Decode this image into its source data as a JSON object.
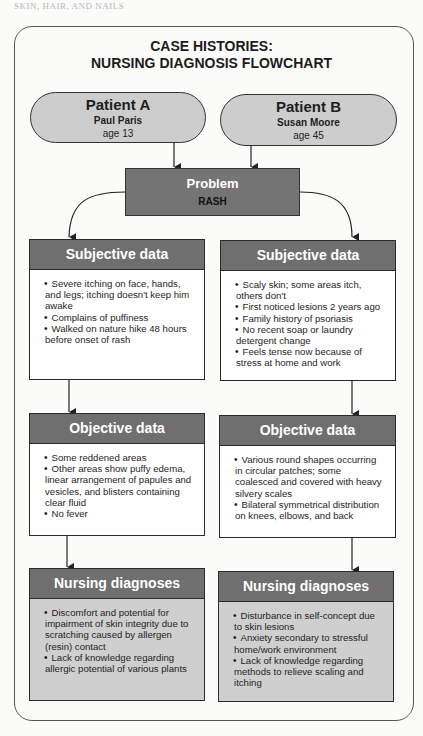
{
  "page_header": "SKIN, HAIR, AND NAILS",
  "title": {
    "line1": "CASE HISTORIES:",
    "line2": "NURSING DIAGNOSIS FLOWCHART"
  },
  "patients": [
    {
      "label": "Patient A",
      "name": "Paul Paris",
      "age": "age 13"
    },
    {
      "label": "Patient B",
      "name": "Susan Moore",
      "age": "age 45"
    }
  ],
  "problem": {
    "label": "Problem",
    "value": "RASH"
  },
  "columns": [
    {
      "subjective": {
        "title": "Subjective data",
        "items": [
          "Severe itching on face, hands, and legs; itching doesn't keep him awake",
          "Complains of puffiness",
          "Walked on nature hike 48 hours before onset of rash"
        ]
      },
      "objective": {
        "title": "Objective data",
        "items": [
          "Some reddened areas",
          "Other areas show puffy edema, linear arrangement of papules and vesicles, and blisters containing clear fluid",
          "No fever"
        ]
      },
      "diagnoses": {
        "title": "Nursing diagnoses",
        "items": [
          "Discomfort and potential for impairment of skin integrity due to scratching caused by allergen (resin) contact",
          "Lack of knowledge regarding allergic potential of various plants"
        ]
      }
    },
    {
      "subjective": {
        "title": "Subjective data",
        "items": [
          "Scaly skin; some areas itch, others don't",
          "First noticed lesions 2 years ago",
          "Family history of psoriasis",
          "No recent soap or laundry detergent change",
          "Feels tense now because of stress at home and work"
        ]
      },
      "objective": {
        "title": "Objective data",
        "items": [
          "Various round shapes occurring in circular patches; some coalesced and covered with heavy silvery scales",
          "Bilateral symmetrical distribution on knees, elbows, and back"
        ]
      },
      "diagnoses": {
        "title": "Nursing diagnoses",
        "items": [
          "Disturbance in self-concept due to skin lesions",
          "Anxiety secondary to stressful home/work environment",
          "Lack of knowledge regarding methods to relieve scaling and itching"
        ]
      }
    }
  ],
  "colors": {
    "header_fill": "#6f6f6f",
    "pill_fill": "#cdcdcd",
    "diagnosis_fill": "#cfcfcf",
    "problem_fill": "#747474"
  }
}
